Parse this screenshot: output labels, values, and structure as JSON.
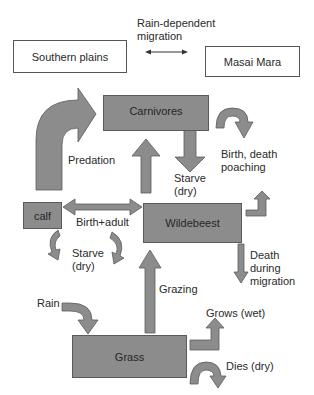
{
  "diagram": {
    "colors": {
      "node_fill": "#8c8c8c",
      "node_border": "#5a5a5a",
      "text": "#2a2a2a",
      "background": "#ffffff"
    },
    "locations": {
      "southern_plains": "Southern plains",
      "masai_mara": "Masai Mara",
      "migration_label": "Rain-dependent\nmigration"
    },
    "nodes": {
      "carnivores": "Carnivores",
      "calf": "calf",
      "wildebeest": "Wildebeest",
      "grass": "Grass"
    },
    "flows": {
      "predation": "Predation",
      "carnivore_starve": "Starve\n(dry)",
      "carnivore_birth_death": "Birth, death\npoaching",
      "birth_adult": "Birth+adult",
      "calf_starve": "Starve\n(dry)",
      "death_migration": "Death\nduring\nmigration",
      "grazing": "Grazing",
      "rain": "Rain",
      "grass_grows": "Grows (wet)",
      "grass_dies": "Dies (dry)"
    }
  }
}
